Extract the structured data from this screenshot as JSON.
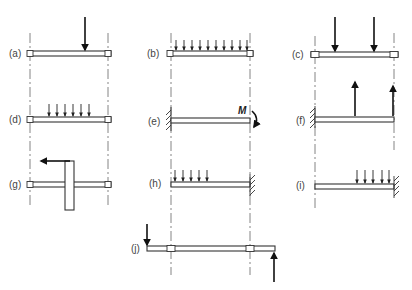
{
  "figure": {
    "cases": [
      {
        "id": "a",
        "label": "(a)",
        "support": "two bearings",
        "loading": "single concentrated load downward"
      },
      {
        "id": "b",
        "label": "(b)",
        "support": "two bearings",
        "loading": "uniformly distributed load over full span"
      },
      {
        "id": "c",
        "label": "(c)",
        "support": "two bearings",
        "loading": "two concentrated loads downward"
      },
      {
        "id": "d",
        "label": "(d)",
        "support": "two bearings",
        "loading": "partial distributed load"
      },
      {
        "id": "e",
        "label": "(e)",
        "support": "cantilever fixed left",
        "loading": "end moment",
        "moment_label": "M"
      },
      {
        "id": "f",
        "label": "(f)",
        "support": "cantilever fixed left",
        "loading": "two concentrated loads upward"
      },
      {
        "id": "g",
        "label": "(g)",
        "support": "two bearings",
        "loading": "gear/disc with tangential force"
      },
      {
        "id": "h",
        "label": "(h)",
        "support": "cantilever fixed right",
        "loading": "partial distributed load near free end"
      },
      {
        "id": "i",
        "label": "(i)",
        "support": "cantilever fixed right",
        "loading": "partial distributed load near fixed end"
      },
      {
        "id": "j",
        "label": "(j)",
        "support": "two bearings with overhangs",
        "loading": "end loads down (left) and up (right)"
      }
    ]
  },
  "colors": {
    "line": "#333333",
    "arrow": "#111111",
    "centerline": "#666666",
    "text": "#444444"
  }
}
